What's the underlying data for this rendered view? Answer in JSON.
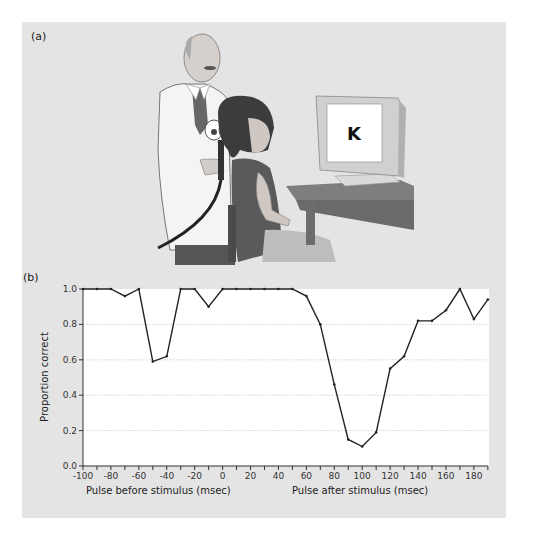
{
  "figure": {
    "panel_a_label": "(a)",
    "panel_b_label": "(b)",
    "monitor_letter": "K"
  },
  "chart_data": {
    "type": "line",
    "title": "",
    "xlabel_left": "Pulse before stimulus (msec)",
    "xlabel_right": "Pulse after stimulus (msec)",
    "ylabel": "Proportion correct",
    "xlim": [
      -100,
      190
    ],
    "ylim": [
      0.0,
      1.0
    ],
    "x_ticks": [
      -100,
      -80,
      -60,
      -40,
      -20,
      0,
      20,
      40,
      60,
      80,
      100,
      120,
      140,
      160,
      180
    ],
    "y_ticks": [
      "0.0",
      "0.2",
      "0.4",
      "0.6",
      "0.8",
      "1.0"
    ],
    "grid": "horizontal dotted",
    "legend": null,
    "series": [
      {
        "name": "Proportion correct",
        "x": [
          -100,
          -90,
          -80,
          -70,
          -60,
          -50,
          -40,
          -30,
          -20,
          -10,
          0,
          10,
          20,
          30,
          40,
          50,
          60,
          70,
          80,
          90,
          100,
          110,
          120,
          130,
          140,
          150,
          160,
          170,
          180,
          190
        ],
        "values": [
          1.0,
          1.0,
          1.0,
          0.96,
          1.0,
          0.59,
          0.62,
          1.0,
          1.0,
          0.9,
          1.0,
          1.0,
          1.0,
          1.0,
          1.0,
          1.0,
          0.96,
          0.8,
          0.46,
          0.15,
          0.11,
          0.19,
          0.55,
          0.62,
          0.82,
          0.82,
          0.88,
          1.0,
          0.83,
          0.94
        ]
      }
    ]
  }
}
